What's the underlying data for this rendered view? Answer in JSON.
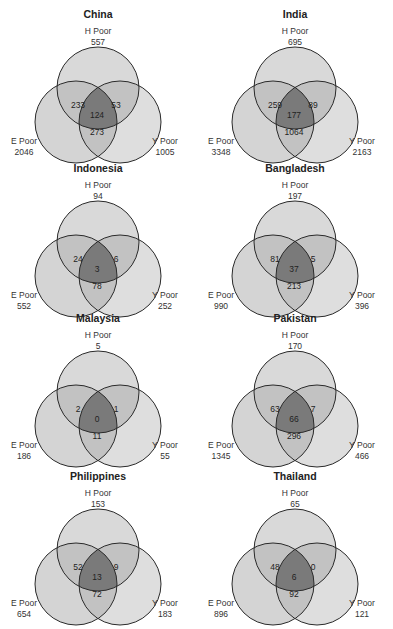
{
  "figure": {
    "type": "venn3-grid",
    "set_labels": {
      "H": "H Poor",
      "E": "E Poor",
      "Y": "Y Poor"
    },
    "colors": {
      "circle_fill": "#d4d4d4",
      "pair_overlap": "#c2c2c2",
      "triple_overlap": "#7a7a7a",
      "stroke": "#2a2a2a",
      "background": "#ffffff"
    }
  },
  "chart_data": [
    {
      "type": "venn",
      "title": "China",
      "H_total": "557",
      "E_total": "2046",
      "Y_total": "1005",
      "HE": "233",
      "HY": "53",
      "EY": "273",
      "HEY": "124"
    },
    {
      "type": "venn",
      "title": "India",
      "H_total": "695",
      "E_total": "3348",
      "Y_total": "2163",
      "HE": "259",
      "HY": "89",
      "EY": "1064",
      "HEY": "177"
    },
    {
      "type": "venn",
      "title": "Indonesia",
      "H_total": "94",
      "E_total": "552",
      "Y_total": "252",
      "HE": "24",
      "HY": "6",
      "EY": "78",
      "HEY": "3"
    },
    {
      "type": "venn",
      "title": "Bangladesh",
      "H_total": "197",
      "E_total": "990",
      "Y_total": "396",
      "HE": "81",
      "HY": "5",
      "EY": "213",
      "HEY": "37"
    },
    {
      "type": "venn",
      "title": "Malaysia",
      "H_total": "5",
      "E_total": "186",
      "Y_total": "55",
      "HE": "2",
      "HY": "1",
      "EY": "11",
      "HEY": "0"
    },
    {
      "type": "venn",
      "title": "Pakistan",
      "H_total": "170",
      "E_total": "1345",
      "Y_total": "466",
      "HE": "63",
      "HY": "7",
      "EY": "296",
      "HEY": "66"
    },
    {
      "type": "venn",
      "title": "Philippines",
      "H_total": "153",
      "E_total": "654",
      "Y_total": "183",
      "HE": "52",
      "HY": "9",
      "EY": "72",
      "HEY": "13"
    },
    {
      "type": "venn",
      "title": "Thailand",
      "H_total": "65",
      "E_total": "896",
      "Y_total": "121",
      "HE": "48",
      "HY": "0",
      "EY": "92",
      "HEY": "6"
    }
  ]
}
